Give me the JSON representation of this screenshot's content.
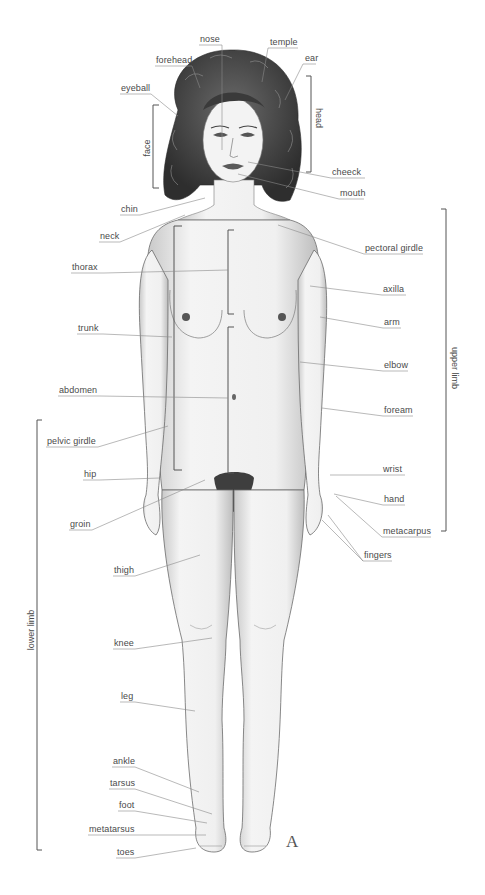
{
  "diagram": {
    "plate_letter": "A",
    "colors": {
      "label_text": "#4a4a4a",
      "leader_line": "#8a8a8a",
      "bracket": "#555555",
      "skin_outline": "#6b6b6b",
      "skin_fill": "#f2f2f2",
      "hair": "#3a3a3a",
      "background": "#ffffff"
    },
    "labels": [
      {
        "id": "nose",
        "text": "nose",
        "x": 200,
        "y": 34
      },
      {
        "id": "temple",
        "text": "temple",
        "x": 270,
        "y": 37
      },
      {
        "id": "forehead",
        "text": "forehead",
        "x": 156,
        "y": 55
      },
      {
        "id": "ear",
        "text": "ear",
        "x": 305,
        "y": 53
      },
      {
        "id": "eyeball",
        "text": "eyeball",
        "x": 121,
        "y": 83
      },
      {
        "id": "cheeck",
        "text": "cheeck",
        "x": 332,
        "y": 167
      },
      {
        "id": "mouth",
        "text": "mouth",
        "x": 340,
        "y": 188
      },
      {
        "id": "chin",
        "text": "chin",
        "x": 121,
        "y": 204
      },
      {
        "id": "neck",
        "text": "neck",
        "x": 100,
        "y": 231
      },
      {
        "id": "pectoral-girdle",
        "text": "pectoral girdle",
        "x": 365,
        "y": 243
      },
      {
        "id": "thorax",
        "text": "thorax",
        "x": 72,
        "y": 262
      },
      {
        "id": "axilla",
        "text": "axilla",
        "x": 383,
        "y": 284
      },
      {
        "id": "arm",
        "text": "arm",
        "x": 384,
        "y": 317
      },
      {
        "id": "trunk",
        "text": "trunk",
        "x": 78,
        "y": 323
      },
      {
        "id": "elbow",
        "text": "elbow",
        "x": 384,
        "y": 360
      },
      {
        "id": "abdomen",
        "text": "abdomen",
        "x": 59,
        "y": 385
      },
      {
        "id": "foream",
        "text": "foream",
        "x": 384,
        "y": 405
      },
      {
        "id": "pelvic-girdle",
        "text": "pelvic girdle",
        "x": 47,
        "y": 436
      },
      {
        "id": "hip",
        "text": "hip",
        "x": 84,
        "y": 469
      },
      {
        "id": "wrist",
        "text": "wrist",
        "x": 383,
        "y": 464
      },
      {
        "id": "hand",
        "text": "hand",
        "x": 384,
        "y": 494
      },
      {
        "id": "groin",
        "text": "groin",
        "x": 70,
        "y": 519
      },
      {
        "id": "metacarpus",
        "text": "metacarpus",
        "x": 383,
        "y": 526
      },
      {
        "id": "fingers",
        "text": "fingers",
        "x": 364,
        "y": 550
      },
      {
        "id": "thigh",
        "text": "thigh",
        "x": 114,
        "y": 565
      },
      {
        "id": "knee",
        "text": "knee",
        "x": 114,
        "y": 638
      },
      {
        "id": "leg",
        "text": "leg",
        "x": 121,
        "y": 691
      },
      {
        "id": "ankle",
        "text": "ankle",
        "x": 113,
        "y": 756
      },
      {
        "id": "tarsus",
        "text": "tarsus",
        "x": 110,
        "y": 778
      },
      {
        "id": "foot",
        "text": "foot",
        "x": 119,
        "y": 800
      },
      {
        "id": "metatarsus",
        "text": "metatarsus",
        "x": 89,
        "y": 824
      },
      {
        "id": "toes",
        "text": "toes",
        "x": 117,
        "y": 847
      }
    ],
    "bracket_labels": [
      {
        "id": "face",
        "text": "face",
        "x": 147,
        "y": 148,
        "rotation": "ccw"
      },
      {
        "id": "head",
        "text": "head",
        "x": 318,
        "y": 118,
        "rotation": "cw"
      },
      {
        "id": "upper-limb",
        "text": "upper limb",
        "x": 454,
        "y": 368,
        "rotation": "cw"
      },
      {
        "id": "lower-limb",
        "text": "lower limb",
        "x": 31,
        "y": 630,
        "rotation": "ccw"
      }
    ]
  }
}
